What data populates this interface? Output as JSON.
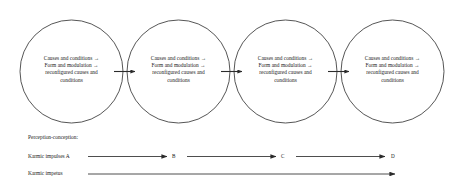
{
  "diagram": {
    "type": "process-cycle-diagram",
    "background_color": "#ffffff",
    "stroke_color": "#2b2b2b",
    "text_color": "#1a1a1a",
    "nodes": [
      {
        "id": "node-1",
        "lines": [
          "Causes and conditions →",
          "Form and modulation →",
          "reconfigured causes and",
          "conditions"
        ]
      },
      {
        "id": "node-2",
        "lines": [
          "Causes and conditions →",
          "Form and modulation →",
          "reconfigured causes and",
          "conditions"
        ]
      },
      {
        "id": "node-3",
        "lines": [
          "Causes and conditions →",
          "Form and modulation →",
          "reconfigured causes and",
          "conditions"
        ]
      },
      {
        "id": "node-4",
        "lines": [
          "Causes and conditions →",
          "Form and modulation →",
          "reconfigured causes and",
          "conditions"
        ]
      }
    ],
    "connector_arrows": [
      {
        "id": "connector-1-2",
        "from": "node-1",
        "to": "node-2"
      },
      {
        "id": "connector-2-3",
        "from": "node-2",
        "to": "node-3"
      },
      {
        "id": "connector-3-4",
        "from": "node-3",
        "to": "node-4"
      }
    ],
    "legend": {
      "perception_label": "Perception-conception:",
      "karmic_impulses_label": "Karmic impulses A",
      "karmic_impetus_label": "Karmic impetus"
    },
    "stage_letters": [
      {
        "id": "stage-a",
        "label": "A"
      },
      {
        "id": "stage-b",
        "label": "B"
      },
      {
        "id": "stage-c",
        "label": "C"
      },
      {
        "id": "stage-d",
        "label": "D"
      }
    ],
    "timeline_arrows": [
      {
        "id": "impulse-arrow-a-b",
        "from": "A",
        "to": "B"
      },
      {
        "id": "impulse-arrow-b-c",
        "from": "B",
        "to": "C"
      },
      {
        "id": "impulse-arrow-c-d",
        "from": "C",
        "to": "D"
      },
      {
        "id": "impetus-arrow",
        "from": "start",
        "to": "end"
      }
    ]
  }
}
